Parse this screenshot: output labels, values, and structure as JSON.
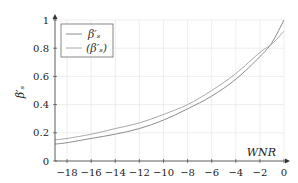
{
  "chart_data": {
    "type": "line",
    "title": "",
    "xlabel": "WNR",
    "ylabel": "β'_s",
    "xlim": [
      -19,
      0
    ],
    "ylim": [
      0,
      1
    ],
    "grid": true,
    "legend_position": "upper-left",
    "xticks": [
      -18,
      -16,
      -14,
      -12,
      -10,
      -8,
      -6,
      -4,
      -2,
      0
    ],
    "yticks": [
      0,
      0.2,
      0.4,
      0.6,
      0.8,
      1
    ],
    "x": [
      -19,
      -18,
      -16,
      -14,
      -12,
      -10,
      -8,
      -6,
      -4,
      -2,
      -1,
      0
    ],
    "series": [
      {
        "name": "β'_s",
        "color": "#8c8c8c",
        "values": [
          0.12,
          0.13,
          0.16,
          0.19,
          0.23,
          0.29,
          0.37,
          0.46,
          0.58,
          0.74,
          0.84,
          1.0
        ]
      },
      {
        "name": "(β'_s)",
        "color": "#a8a8a8",
        "values": [
          0.15,
          0.16,
          0.19,
          0.23,
          0.27,
          0.33,
          0.4,
          0.5,
          0.62,
          0.77,
          0.83,
          0.92
        ]
      }
    ]
  },
  "legend": {
    "items": [
      {
        "label": "β′ₛ"
      },
      {
        "label": "(β′ₛ)"
      }
    ]
  },
  "axes": {
    "xlabel": "WNR",
    "ylabel": "β′ₛ",
    "xtick_labels": [
      "−18",
      "−16",
      "−14",
      "−12",
      "−10",
      "−8",
      "−6",
      "−4",
      "−2",
      "0"
    ],
    "ytick_labels": [
      "0",
      "0.2",
      "0.4",
      "0.6",
      "0.8",
      "1"
    ]
  }
}
